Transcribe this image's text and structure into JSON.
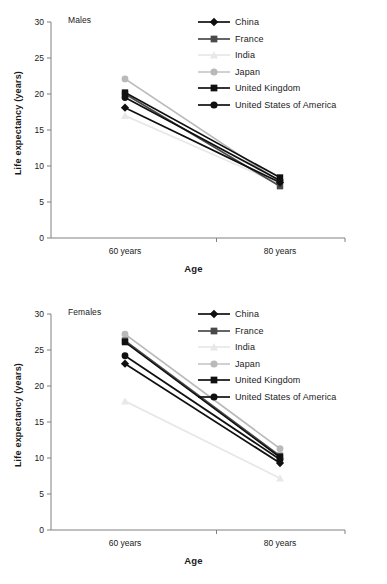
{
  "figure": {
    "background": "#ffffff",
    "panels": [
      "Males",
      "Females"
    ]
  },
  "axis": {
    "ylabel": "Life expectancy (years)",
    "xlabel": "Age",
    "yticks": [
      "30",
      "25",
      "20",
      "15",
      "10",
      "5",
      "0"
    ],
    "xticks": [
      "60 years",
      "80 years"
    ],
    "axis_color": "#808080"
  },
  "legend": {
    "entries": [
      {
        "label": "China",
        "marker": "diamond",
        "color": "#101010",
        "line_color": "#101010"
      },
      {
        "label": "France",
        "marker": "square",
        "color": "#4a4a4a",
        "line_color": "#4a4a4a"
      },
      {
        "label": "India",
        "marker": "triangle",
        "color": "#e8e8e8",
        "line_color": "#e8e8e8"
      },
      {
        "label": "Japan",
        "marker": "circle",
        "color": "#b9b9b9",
        "line_color": "#c9c9c9"
      },
      {
        "label": "United Kingdom",
        "marker": "square",
        "color": "#101010",
        "line_color": "#101010"
      },
      {
        "label": "United States of America",
        "marker": "circle",
        "color": "#101010",
        "line_color": "#101010"
      }
    ]
  },
  "panel_males": {
    "title": "Males"
  },
  "panel_females": {
    "title": "Females"
  },
  "chart_data": [
    {
      "type": "line",
      "title": "Males",
      "xlabel": "Age",
      "ylabel": "Life expectancy (years)",
      "categories": [
        "60 years",
        "80 years"
      ],
      "ylim": [
        0,
        30
      ],
      "ytick_step": 5,
      "grid": false,
      "legend_position": "top-right",
      "series": [
        {
          "name": "China",
          "values": [
            18.1,
            7.7
          ],
          "marker": "diamond",
          "color": "#101010"
        },
        {
          "name": "France",
          "values": [
            20.0,
            7.2
          ],
          "marker": "square",
          "color": "#4a4a4a"
        },
        {
          "name": "India",
          "values": [
            17.0,
            7.5
          ],
          "marker": "triangle",
          "color": "#e8e8e8"
        },
        {
          "name": "Japan",
          "values": [
            22.1,
            7.8
          ],
          "marker": "circle",
          "color": "#b9b9b9"
        },
        {
          "name": "United Kingdom",
          "values": [
            20.2,
            8.4
          ],
          "marker": "square",
          "color": "#101010"
        },
        {
          "name": "United States of America",
          "values": [
            19.5,
            8.0
          ],
          "marker": "circle",
          "color": "#101010"
        }
      ]
    },
    {
      "type": "line",
      "title": "Females",
      "xlabel": "Age",
      "ylabel": "Life expectancy (years)",
      "categories": [
        "60 years",
        "80 years"
      ],
      "ylim": [
        0,
        30
      ],
      "ytick_step": 5,
      "grid": false,
      "legend_position": "top-right",
      "series": [
        {
          "name": "China",
          "values": [
            23.1,
            9.3
          ],
          "marker": "diamond",
          "color": "#101010"
        },
        {
          "name": "France",
          "values": [
            26.3,
            10.3
          ],
          "marker": "square",
          "color": "#4a4a4a"
        },
        {
          "name": "India",
          "values": [
            17.9,
            7.2
          ],
          "marker": "triangle",
          "color": "#e8e8e8"
        },
        {
          "name": "Japan",
          "values": [
            27.2,
            11.3
          ],
          "marker": "circle",
          "color": "#b9b9b9"
        },
        {
          "name": "United Kingdom",
          "values": [
            26.1,
            10.1
          ],
          "marker": "square",
          "color": "#101010"
        },
        {
          "name": "United States of America",
          "values": [
            24.2,
            9.8
          ],
          "marker": "circle",
          "color": "#101010"
        }
      ]
    }
  ]
}
